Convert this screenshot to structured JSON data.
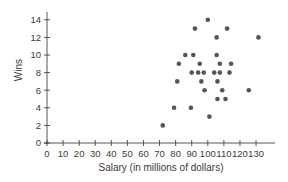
{
  "chart_data": {
    "type": "scatter",
    "title": "",
    "xlabel": "Salary (in millions of dollars)",
    "ylabel": "Wins",
    "xlim": [
      0,
      130
    ],
    "ylim": [
      0,
      14
    ],
    "x_ticks": [
      0,
      10,
      20,
      30,
      40,
      50,
      60,
      70,
      80,
      90,
      100,
      110,
      120,
      130
    ],
    "y_ticks": [
      0,
      2,
      4,
      6,
      8,
      10,
      12,
      14
    ],
    "grid": false,
    "legend": null,
    "marker_color": "#555555",
    "points": [
      {
        "x": 72,
        "y": 2
      },
      {
        "x": 79,
        "y": 4
      },
      {
        "x": 89.5,
        "y": 4
      },
      {
        "x": 101,
        "y": 3
      },
      {
        "x": 106,
        "y": 5
      },
      {
        "x": 111,
        "y": 5
      },
      {
        "x": 98,
        "y": 6
      },
      {
        "x": 109,
        "y": 6
      },
      {
        "x": 125.5,
        "y": 6
      },
      {
        "x": 81,
        "y": 7
      },
      {
        "x": 96,
        "y": 7
      },
      {
        "x": 106,
        "y": 7
      },
      {
        "x": 90,
        "y": 8
      },
      {
        "x": 94,
        "y": 8
      },
      {
        "x": 97.5,
        "y": 8
      },
      {
        "x": 104,
        "y": 8
      },
      {
        "x": 107.5,
        "y": 8
      },
      {
        "x": 113.5,
        "y": 8
      },
      {
        "x": 82,
        "y": 9
      },
      {
        "x": 95,
        "y": 9
      },
      {
        "x": 107.5,
        "y": 9
      },
      {
        "x": 114.5,
        "y": 9
      },
      {
        "x": 86,
        "y": 10
      },
      {
        "x": 91,
        "y": 10
      },
      {
        "x": 105.5,
        "y": 10
      },
      {
        "x": 105.5,
        "y": 12
      },
      {
        "x": 131.5,
        "y": 12
      },
      {
        "x": 92,
        "y": 13
      },
      {
        "x": 112,
        "y": 13
      },
      {
        "x": 100,
        "y": 14
      }
    ]
  }
}
